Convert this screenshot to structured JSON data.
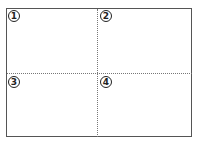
{
  "diagram": {
    "layout": "2x2 grid of quadrants divided by dotted lines",
    "quadrants": [
      {
        "label": "①"
      },
      {
        "label": "②"
      },
      {
        "label": "③"
      },
      {
        "label": "④"
      }
    ],
    "colors": {
      "border": "#555555",
      "divider": "#777777",
      "text": "#222222",
      "background": "#ffffff"
    }
  }
}
